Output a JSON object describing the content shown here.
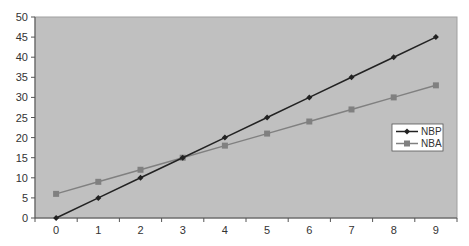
{
  "chart_data": {
    "type": "line",
    "title": "",
    "xlabel": "",
    "ylabel": "",
    "x": [
      0,
      1,
      2,
      3,
      4,
      5,
      6,
      7,
      8,
      9
    ],
    "categories": [
      "0",
      "1",
      "2",
      "3",
      "4",
      "5",
      "6",
      "7",
      "8",
      "9"
    ],
    "series": [
      {
        "name": "NBP",
        "values": [
          0,
          5,
          10,
          15,
          20,
          25,
          30,
          35,
          40,
          45
        ],
        "color": "#222222",
        "marker": "diamond"
      },
      {
        "name": "NBA",
        "values": [
          6,
          9,
          12,
          15,
          18,
          21,
          24,
          27,
          30,
          33
        ],
        "color": "#808080",
        "marker": "square"
      }
    ],
    "ylim": [
      0,
      50
    ],
    "yticks": [
      0,
      5,
      10,
      15,
      20,
      25,
      30,
      35,
      40,
      45,
      50
    ],
    "grid": false,
    "legend_position": "right",
    "plot_background": "#c0c0c0"
  },
  "legend": {
    "items": [
      {
        "label": "NBP"
      },
      {
        "label": "NBA"
      }
    ]
  }
}
